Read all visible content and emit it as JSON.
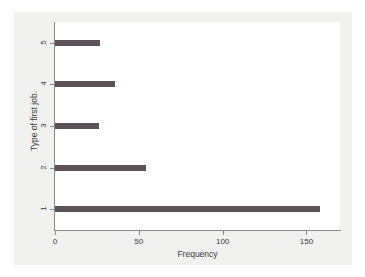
{
  "chart_data": {
    "type": "bar",
    "orientation": "horizontal",
    "title": "",
    "xlabel": "Frequency",
    "ylabel": "Type of first job.",
    "categories": [
      "1",
      "2",
      "3",
      "4",
      "5"
    ],
    "values": [
      158,
      54,
      26,
      36,
      27
    ],
    "xlim": [
      0,
      170
    ],
    "xticks": [
      0,
      50,
      100,
      150
    ],
    "xtick_labels": [
      "0",
      "50",
      "100",
      "150"
    ],
    "ytick_labels": [
      "1",
      "2",
      "3",
      "4",
      "5"
    ],
    "grid": false,
    "legend": false,
    "bar_color": "#5c5258",
    "plot_background": "#ffffff",
    "figure_background": "#f1f1ef",
    "axis_color": "#8a8a8a"
  }
}
